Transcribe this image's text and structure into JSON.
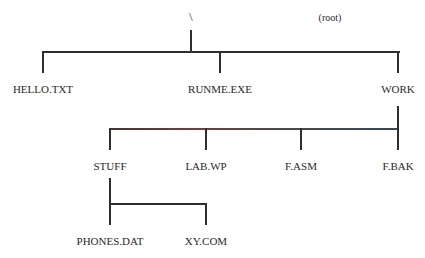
{
  "root": {
    "symbol": "\\",
    "caption": "(root)"
  },
  "level1": [
    {
      "name": "HELLO.TXT",
      "x": 43
    },
    {
      "name": "RUNME.EXE",
      "x": 220
    },
    {
      "name": "WORK",
      "x": 398
    }
  ],
  "level2": [
    {
      "name": "STUFF",
      "x": 110
    },
    {
      "name": "LAB.WP",
      "x": 206
    },
    {
      "name": "F.ASM",
      "x": 301
    },
    {
      "name": "F.BAK",
      "x": 398
    }
  ],
  "level3": [
    {
      "name": "PHONES.DAT",
      "x": 110
    },
    {
      "name": "XY.COM",
      "x": 206
    }
  ]
}
